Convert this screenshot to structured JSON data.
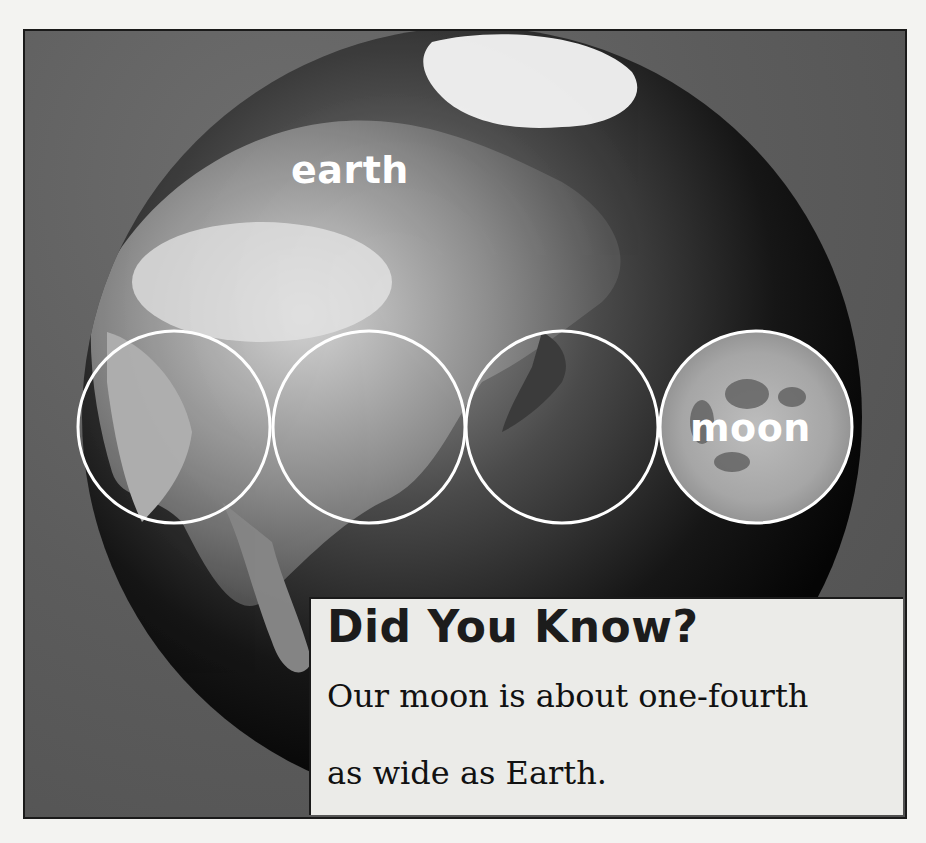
{
  "illustration": {
    "earth_label": "earth",
    "moon_label": "moon",
    "comparison_circles": 4,
    "caption": "Earth with four moon-sized circles drawn across it"
  },
  "info_box": {
    "title": "Did You Know?",
    "body_line_1": "Our moon is about one-fourth",
    "body_line_2": "as wide as Earth."
  },
  "colors": {
    "background": "#5c5c5c",
    "info_box": "#ebebe8",
    "label_text": "#ffffff",
    "circle_outline": "#ffffff"
  }
}
